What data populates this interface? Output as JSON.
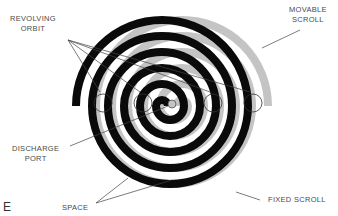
{
  "figure": {
    "corner_letter": "E",
    "labels": {
      "revolving_orbit": [
        "REVOLVING",
        "ORBIT"
      ],
      "movable_scroll": [
        "MOVABLE",
        "SCROLL"
      ],
      "discharge_port": [
        "DISCHARGE",
        "PORT"
      ],
      "space": "SPACE",
      "fixed_scroll": "FIXED SCROLL"
    },
    "colors": {
      "fixed_scroll": "#0a0a0a",
      "movable_scroll": "#c4c4c4",
      "outline": "#555555",
      "background": "#ffffff"
    }
  }
}
